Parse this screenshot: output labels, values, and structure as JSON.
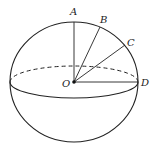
{
  "diagram": {
    "type": "sphere-geometry",
    "labels": {
      "A": "A",
      "B": "B",
      "C": "C",
      "D": "D",
      "O": "O"
    },
    "colors": {
      "stroke": "#222222",
      "background": "#ffffff"
    }
  }
}
